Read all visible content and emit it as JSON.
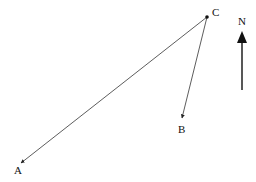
{
  "diagram": {
    "type": "vector-diagram",
    "points": {
      "A": {
        "label": "A",
        "x": 21,
        "y": 163
      },
      "B": {
        "label": "B",
        "x": 182,
        "y": 118
      },
      "C": {
        "label": "C",
        "x": 207,
        "y": 17
      }
    },
    "arrows": [
      {
        "from": "C",
        "to": "A"
      },
      {
        "from": "C",
        "to": "B"
      }
    ],
    "north_arrow": {
      "label": "N",
      "x": 242,
      "y_tip": 31,
      "y_tail": 90
    }
  },
  "colors": {
    "stroke": "#222222",
    "background": "#ffffff"
  }
}
